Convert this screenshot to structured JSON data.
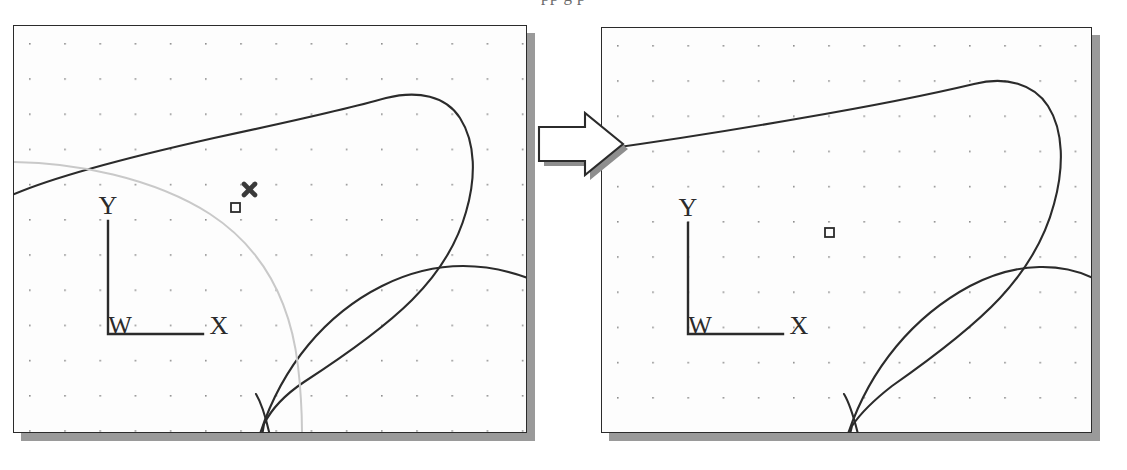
{
  "figure": {
    "title_fragment": "pp g                                    p",
    "kind": "two-panel-before-after-diagram",
    "background_color": "#ffffff",
    "ink_color": "#2b2b2b",
    "faint_ink_color": "#c9c9c9",
    "shadow_color": "#9a9a9a"
  },
  "panels": [
    {
      "id": "left-panel",
      "role": "before",
      "frame": {
        "x": 13,
        "y": 25,
        "width": 514,
        "height": 408
      },
      "shadow_offset": 8,
      "grid": {
        "type": "dot-grid",
        "origin_x": 28,
        "origin_y": 42,
        "spacing": 35.2,
        "dot_size": 1.6,
        "color": "#8d8d8d"
      },
      "axes": {
        "origin_label": "W",
        "x_label": "X",
        "y_label": "Y",
        "origin_px": {
          "x": 107,
          "y": 333
        },
        "x_axis_length": 95,
        "y_axis_length": 113
      },
      "markers": [
        {
          "name": "x-cross-marker",
          "shape": "cross-x",
          "x": 248,
          "y": 190,
          "size": 13,
          "color": "#3a3a3a"
        },
        {
          "name": "square-marker",
          "shape": "square-outline",
          "x": 234,
          "y": 207,
          "size": 9,
          "color": "#2b2b2b"
        }
      ],
      "curves": [
        {
          "name": "blob-outline",
          "style": "solid-dark"
        },
        {
          "name": "lower-arc",
          "style": "solid-dark"
        },
        {
          "name": "construction-arc",
          "style": "faint-gray"
        }
      ]
    },
    {
      "id": "right-panel",
      "role": "after",
      "frame": {
        "x": 601,
        "y": 27,
        "width": 491,
        "height": 406
      },
      "shadow_offset": 8,
      "grid": {
        "type": "dot-grid",
        "origin_x": 616,
        "origin_y": 44,
        "spacing": 35.2,
        "dot_size": 1.6,
        "color": "#8d8d8d"
      },
      "axes": {
        "origin_label": "W",
        "x_label": "X",
        "y_label": "Y",
        "origin_px": {
          "x": 687,
          "y": 333
        },
        "x_axis_length": 95,
        "y_axis_length": 113
      },
      "markers": [
        {
          "name": "square-marker",
          "shape": "square-outline",
          "x": 828,
          "y": 231,
          "size": 9,
          "color": "#2b2b2b"
        }
      ],
      "curves": [
        {
          "name": "blob-outline",
          "style": "solid-dark"
        },
        {
          "name": "lower-arc",
          "style": "solid-dark"
        }
      ]
    }
  ],
  "arrow": {
    "name": "transition-arrow",
    "direction": "right",
    "x": 538,
    "y": 112,
    "width": 84,
    "height": 58,
    "fill": "#ffffff",
    "stroke": "#2b2b2b",
    "shadow": "#8e8e8e"
  }
}
